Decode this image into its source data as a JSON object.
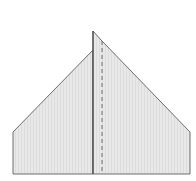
{
  "diagram": {
    "type": "paper-folding-step",
    "colors": {
      "background": "#ffffff",
      "paper_fill": "#e6e6e6",
      "outline": "#6e6e6e",
      "fold_line": "#4a4a4a",
      "dashed_crease": "#6a6a6a"
    },
    "shapes": {
      "left_panel": "13,132 93,50 93,174 13,174",
      "right_panel": "93,31 102,41 190,132 190,174 93,174",
      "center_fold": {
        "x1": 93,
        "y1": 31,
        "x2": 93,
        "y2": 174
      },
      "dashed_crease": {
        "x1": 102,
        "y1": 41,
        "x2": 102,
        "y2": 174
      }
    }
  }
}
